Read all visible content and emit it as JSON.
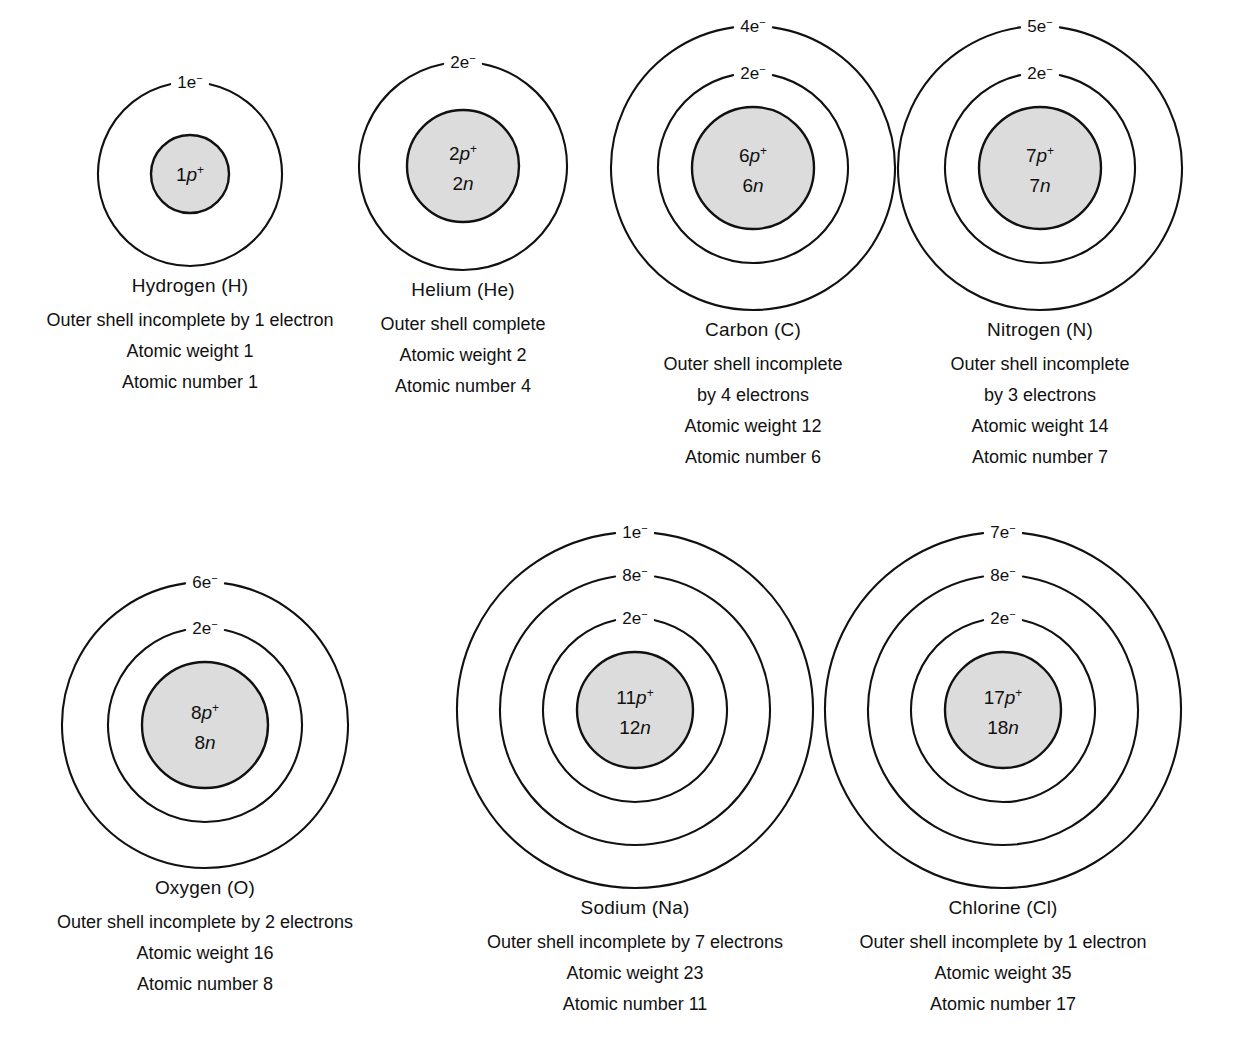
{
  "diagram": {
    "nucleus_fill": "#dcdcdc",
    "stroke": "#111111",
    "background": "#ffffff"
  },
  "atoms": [
    {
      "id": "hydrogen",
      "name": "Hydrogen (H)",
      "nucleus": {
        "protons": "1p",
        "protons_sup": "+",
        "neutrons": ""
      },
      "shells": [
        {
          "label": "1e",
          "sup": "−"
        }
      ],
      "caption": [
        "Outer shell incomplete by 1 electron",
        "Atomic weight 1",
        "Atomic number 1"
      ]
    },
    {
      "id": "helium",
      "name": "Helium (He)",
      "nucleus": {
        "protons": "2p",
        "protons_sup": "+",
        "neutrons": "2n"
      },
      "shells": [
        {
          "label": "2e",
          "sup": "−"
        }
      ],
      "caption": [
        "Outer shell complete",
        "Atomic weight 2",
        "Atomic number 4"
      ]
    },
    {
      "id": "carbon",
      "name": "Carbon (C)",
      "nucleus": {
        "protons": "6p",
        "protons_sup": "+",
        "neutrons": "6n"
      },
      "shells": [
        {
          "label": "4e",
          "sup": "−"
        },
        {
          "label": "2e",
          "sup": "−"
        }
      ],
      "caption": [
        "Outer shell incomplete",
        "by 4 electrons",
        "Atomic weight 12",
        "Atomic number 6"
      ]
    },
    {
      "id": "nitrogen",
      "name": "Nitrogen (N)",
      "nucleus": {
        "protons": "7p",
        "protons_sup": "+",
        "neutrons": "7n"
      },
      "shells": [
        {
          "label": "5e",
          "sup": "−"
        },
        {
          "label": "2e",
          "sup": "−"
        }
      ],
      "caption": [
        "Outer shell incomplete",
        "by 3 electrons",
        "Atomic weight 14",
        "Atomic number 7"
      ]
    },
    {
      "id": "oxygen",
      "name": "Oxygen (O)",
      "nucleus": {
        "protons": "8p",
        "protons_sup": "+",
        "neutrons": "8n"
      },
      "shells": [
        {
          "label": "6e",
          "sup": "−"
        },
        {
          "label": "2e",
          "sup": "−"
        }
      ],
      "caption": [
        "Outer shell incomplete by 2 electrons",
        "Atomic weight 16",
        "Atomic number 8"
      ]
    },
    {
      "id": "sodium",
      "name": "Sodium (Na)",
      "nucleus": {
        "protons": "11p",
        "protons_sup": "+",
        "neutrons": "12n"
      },
      "shells": [
        {
          "label": "1e",
          "sup": "−"
        },
        {
          "label": "8e",
          "sup": "−"
        },
        {
          "label": "2e",
          "sup": "−"
        }
      ],
      "caption": [
        "Outer shell incomplete by 7 electrons",
        "Atomic weight 23",
        "Atomic number 11"
      ]
    },
    {
      "id": "chlorine",
      "name": "Chlorine (Cl)",
      "nucleus": {
        "protons": "17p",
        "protons_sup": "+",
        "neutrons": "18n"
      },
      "shells": [
        {
          "label": "7e",
          "sup": "−"
        },
        {
          "label": "8e",
          "sup": "−"
        },
        {
          "label": "2e",
          "sup": "−"
        }
      ],
      "caption": [
        "Outer shell incomplete by 1 electron",
        "Atomic weight 35",
        "Atomic number 17"
      ]
    }
  ]
}
